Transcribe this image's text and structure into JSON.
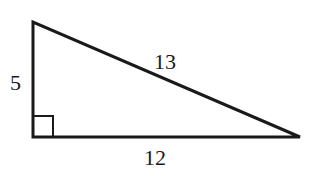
{
  "diagram": {
    "type": "right-triangle",
    "stroke_color": "#1a1a1a",
    "background": "#ffffff",
    "vertices": {
      "top": [
        33,
        22
      ],
      "right_angle": [
        33,
        137
      ],
      "right": [
        300,
        137
      ]
    },
    "right_angle_marker": {
      "x": 33,
      "y": 116,
      "size": 20
    },
    "labels": {
      "vertical_leg": "5",
      "hypotenuse": "13",
      "horizontal_leg": "12"
    }
  }
}
